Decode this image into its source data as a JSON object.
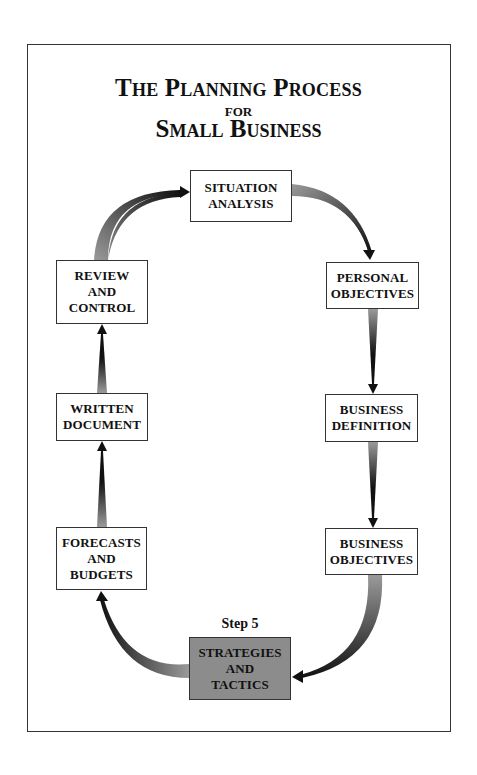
{
  "title": {
    "line1": "The Planning Process",
    "line2": "for",
    "line3": "Small Business"
  },
  "steps": [
    {
      "id": "situation-analysis",
      "lines": [
        "SITUATION",
        "ANALYSIS"
      ]
    },
    {
      "id": "personal-objectives",
      "lines": [
        "PERSONAL",
        "OBJECTIVES"
      ]
    },
    {
      "id": "business-definition",
      "lines": [
        "BUSINESS",
        "DEFINITION"
      ]
    },
    {
      "id": "business-objectives",
      "lines": [
        "BUSINESS",
        "OBJECTIVES"
      ]
    },
    {
      "id": "strategies-and-tactics",
      "lines": [
        "STRATEGIES",
        "AND",
        "TACTICS"
      ],
      "highlighted": true
    },
    {
      "id": "forecasts-and-budgets",
      "lines": [
        "FORECASTS",
        "AND",
        "BUDGETS"
      ]
    },
    {
      "id": "written-document",
      "lines": [
        "WRITTEN",
        "DOCUMENT"
      ]
    },
    {
      "id": "review-and-control",
      "lines": [
        "REVIEW",
        "AND",
        "CONTROL"
      ]
    }
  ],
  "current_step_label": "Step 5",
  "colors": {
    "highlight_fill": "#8c8c8c",
    "border": "#333333",
    "arrow_dark": "#111111",
    "arrow_light": "#9a9a9a"
  }
}
